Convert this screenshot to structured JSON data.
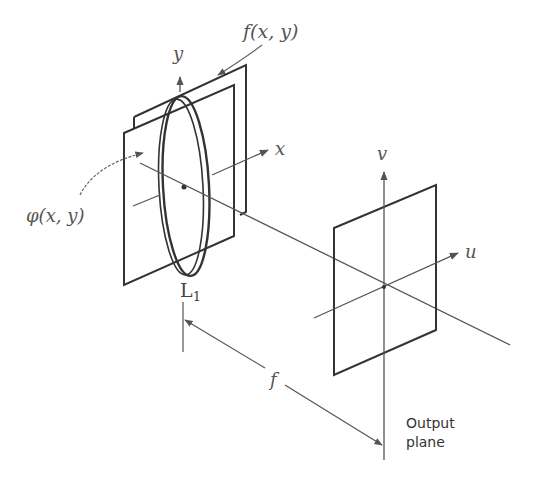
{
  "labels": {
    "f_xy": "f(x, y)",
    "phi_xy": "φ(x, y)",
    "axis_y": "y",
    "axis_x": "x",
    "axis_v": "v",
    "axis_u": "u",
    "lens": "L",
    "lens_subscript": "1",
    "focal_length": "f",
    "output_plane_line1": "Output",
    "output_plane_line2": "plane"
  },
  "colors": {
    "line": "#4a4a4a",
    "frame": "#333333",
    "background": "#ffffff"
  }
}
